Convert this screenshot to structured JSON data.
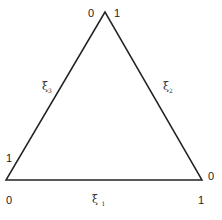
{
  "diagram": {
    "type": "barycentric-triangle",
    "vertices": {
      "top": {
        "left_label": "0",
        "right_label": "1"
      },
      "bottom_left": {
        "upper_label": "1",
        "lower_label": "0"
      },
      "bottom_right": {
        "right_label": "0",
        "lower_label": "1"
      }
    },
    "edges": {
      "bottom": {
        "symbol": "ξ",
        "subscript": "1"
      },
      "right": {
        "symbol": "ξ",
        "subscript": "2"
      },
      "left": {
        "symbol": "ξ",
        "subscript": "3"
      }
    },
    "colors": {
      "line": "#222222",
      "background": "#ffffff"
    }
  }
}
